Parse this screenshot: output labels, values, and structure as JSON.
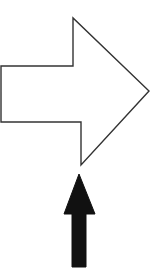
{
  "diagram": {
    "background": "#ffffff",
    "shapes": [
      {
        "id": "outlined-right-arrow",
        "kind": "block-arrow",
        "direction": "right",
        "fill": "#ffffff",
        "stroke": "#333333",
        "points": "1,66 73,66 73,18 149,91 81,165 81,122 1,122"
      },
      {
        "id": "solid-up-arrow",
        "kind": "block-arrow",
        "direction": "up",
        "fill": "#111111",
        "stroke": "#111111",
        "points": "79,174 95,214 86,214 86,267 72,267 72,214 64,214"
      }
    ]
  }
}
